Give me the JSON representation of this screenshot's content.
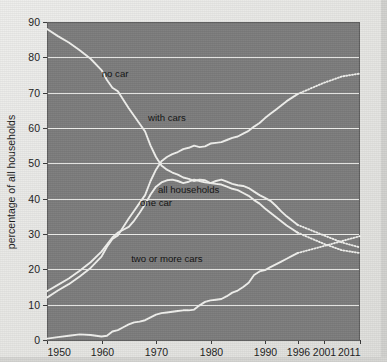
{
  "chart_data": {
    "type": "line",
    "title": "",
    "subtitle": "",
    "xlabel": "",
    "ylabel": "percentage of all households",
    "xlim": [
      1950,
      2011
    ],
    "ylim": [
      0,
      90
    ],
    "grid": true,
    "grid_axis": "y",
    "legend_position": "inline-labels",
    "x_tick_labels": [
      "1950",
      "1960",
      "1970",
      "1980",
      "1990",
      "1996",
      "2001",
      "2011"
    ],
    "x_tick_values": [
      1950,
      1960,
      1970,
      1980,
      1990,
      1996,
      2001,
      2011
    ],
    "y_tick_labels": [
      "0",
      "10",
      "20",
      "30",
      "40",
      "50",
      "60",
      "70",
      "80",
      "90"
    ],
    "y_tick_values": [
      0,
      10,
      20,
      30,
      40,
      50,
      60,
      70,
      80,
      90
    ],
    "colors": {
      "plot_background": "#7d7d7d",
      "page_background": "#e9e9e7",
      "line": "#f1f1ee",
      "gridline": "#ededea",
      "text": "#111111"
    },
    "annotations": [
      {
        "text": "no car",
        "x": 1962.5,
        "y": 74.5
      },
      {
        "text": "with cars",
        "x": 1972.0,
        "y": 62.0
      },
      {
        "text": "all households",
        "x": 1976.0,
        "y": 41.5
      },
      {
        "text": "one car",
        "x": 1970.0,
        "y": 38.0
      },
      {
        "text": "two or more cars",
        "x": 1972.0,
        "y": 22.0
      }
    ],
    "series": [
      {
        "name": "no car",
        "solid_until": 1996,
        "values": [
          [
            1950,
            88.0
          ],
          [
            1952,
            86.0
          ],
          [
            1954,
            84.2
          ],
          [
            1956,
            82.0
          ],
          [
            1958,
            79.6
          ],
          [
            1960,
            76.4
          ],
          [
            1961,
            73.6
          ],
          [
            1962,
            71.4
          ],
          [
            1963,
            70.4
          ],
          [
            1964,
            68.0
          ],
          [
            1965,
            65.6
          ],
          [
            1966,
            63.4
          ],
          [
            1967,
            61.2
          ],
          [
            1968,
            59.0
          ],
          [
            1969,
            55.0
          ],
          [
            1970,
            51.8
          ],
          [
            1971,
            49.4
          ],
          [
            1972,
            48.2
          ],
          [
            1973,
            47.4
          ],
          [
            1974,
            46.8
          ],
          [
            1975,
            46.0
          ],
          [
            1976,
            45.6
          ],
          [
            1977,
            45.0
          ],
          [
            1978,
            45.4
          ],
          [
            1979,
            45.2
          ],
          [
            1980,
            44.4
          ],
          [
            1981,
            44.2
          ],
          [
            1982,
            44.0
          ],
          [
            1983,
            43.4
          ],
          [
            1984,
            42.8
          ],
          [
            1985,
            42.4
          ],
          [
            1986,
            41.6
          ],
          [
            1987,
            40.8
          ],
          [
            1988,
            39.6
          ],
          [
            1989,
            38.6
          ],
          [
            1990,
            37.2
          ],
          [
            1991,
            36.0
          ],
          [
            1992,
            34.8
          ],
          [
            1993,
            33.6
          ],
          [
            1994,
            32.4
          ],
          [
            1995,
            31.4
          ],
          [
            1996,
            30.4
          ],
          [
            2001,
            27.2
          ],
          [
            2006,
            25.4
          ],
          [
            2011,
            24.6
          ]
        ]
      },
      {
        "name": "with cars",
        "solid_until": 1996,
        "values": [
          [
            1950,
            12.0
          ],
          [
            1952,
            14.0
          ],
          [
            1954,
            15.8
          ],
          [
            1956,
            18.0
          ],
          [
            1958,
            20.4
          ],
          [
            1960,
            23.6
          ],
          [
            1961,
            26.4
          ],
          [
            1962,
            28.6
          ],
          [
            1963,
            29.6
          ],
          [
            1964,
            32.0
          ],
          [
            1965,
            34.4
          ],
          [
            1966,
            36.6
          ],
          [
            1967,
            38.8
          ],
          [
            1968,
            41.0
          ],
          [
            1969,
            45.0
          ],
          [
            1970,
            48.2
          ],
          [
            1971,
            50.6
          ],
          [
            1972,
            51.8
          ],
          [
            1973,
            52.6
          ],
          [
            1974,
            53.2
          ],
          [
            1975,
            54.0
          ],
          [
            1976,
            54.4
          ],
          [
            1977,
            55.0
          ],
          [
            1978,
            54.6
          ],
          [
            1979,
            54.8
          ],
          [
            1980,
            55.6
          ],
          [
            1981,
            55.8
          ],
          [
            1982,
            56.0
          ],
          [
            1983,
            56.6
          ],
          [
            1984,
            57.2
          ],
          [
            1985,
            57.6
          ],
          [
            1986,
            58.4
          ],
          [
            1987,
            59.2
          ],
          [
            1988,
            60.4
          ],
          [
            1989,
            61.4
          ],
          [
            1990,
            62.8
          ],
          [
            1991,
            64.0
          ],
          [
            1992,
            65.2
          ],
          [
            1993,
            66.4
          ],
          [
            1994,
            67.6
          ],
          [
            1995,
            68.6
          ],
          [
            1996,
            69.6
          ],
          [
            2001,
            72.8
          ],
          [
            2006,
            74.6
          ],
          [
            2011,
            75.4
          ]
        ]
      },
      {
        "name": "one car",
        "solid_until": 1996,
        "values": [
          [
            1950,
            13.8
          ],
          [
            1952,
            15.6
          ],
          [
            1954,
            17.4
          ],
          [
            1956,
            19.6
          ],
          [
            1958,
            22.0
          ],
          [
            1960,
            25.0
          ],
          [
            1961,
            27.0
          ],
          [
            1962,
            29.0
          ],
          [
            1963,
            30.4
          ],
          [
            1964,
            31.2
          ],
          [
            1965,
            32.0
          ],
          [
            1966,
            33.8
          ],
          [
            1967,
            36.0
          ],
          [
            1968,
            38.4
          ],
          [
            1969,
            41.2
          ],
          [
            1970,
            43.4
          ],
          [
            1971,
            44.6
          ],
          [
            1972,
            45.2
          ],
          [
            1973,
            45.4
          ],
          [
            1974,
            45.0
          ],
          [
            1975,
            44.4
          ],
          [
            1976,
            44.8
          ],
          [
            1977,
            45.4
          ],
          [
            1978,
            45.0
          ],
          [
            1979,
            44.6
          ],
          [
            1980,
            44.4
          ],
          [
            1981,
            45.0
          ],
          [
            1982,
            45.4
          ],
          [
            1983,
            44.8
          ],
          [
            1984,
            44.2
          ],
          [
            1985,
            43.8
          ],
          [
            1986,
            43.6
          ],
          [
            1987,
            43.0
          ],
          [
            1988,
            42.0
          ],
          [
            1989,
            41.0
          ],
          [
            1990,
            40.2
          ],
          [
            1991,
            39.4
          ],
          [
            1992,
            38.0
          ],
          [
            1993,
            36.4
          ],
          [
            1994,
            35.0
          ],
          [
            1995,
            33.8
          ],
          [
            1996,
            32.6
          ],
          [
            2001,
            29.6
          ],
          [
            2006,
            27.6
          ],
          [
            2011,
            26.2
          ]
        ]
      },
      {
        "name": "two or more cars",
        "solid_until": 1996,
        "values": [
          [
            1950,
            0.4
          ],
          [
            1952,
            0.8
          ],
          [
            1954,
            1.2
          ],
          [
            1956,
            1.6
          ],
          [
            1958,
            1.4
          ],
          [
            1960,
            1.0
          ],
          [
            1961,
            1.2
          ],
          [
            1962,
            2.4
          ],
          [
            1963,
            2.8
          ],
          [
            1964,
            3.6
          ],
          [
            1965,
            4.4
          ],
          [
            1966,
            5.0
          ],
          [
            1967,
            5.2
          ],
          [
            1968,
            5.6
          ],
          [
            1969,
            6.4
          ],
          [
            1970,
            7.2
          ],
          [
            1971,
            7.6
          ],
          [
            1972,
            7.8
          ],
          [
            1973,
            8.0
          ],
          [
            1974,
            8.2
          ],
          [
            1975,
            8.4
          ],
          [
            1976,
            8.4
          ],
          [
            1977,
            8.6
          ],
          [
            1978,
            9.8
          ],
          [
            1979,
            10.8
          ],
          [
            1980,
            11.2
          ],
          [
            1981,
            11.4
          ],
          [
            1982,
            11.6
          ],
          [
            1983,
            12.4
          ],
          [
            1984,
            13.4
          ],
          [
            1985,
            14.0
          ],
          [
            1986,
            15.0
          ],
          [
            1987,
            16.2
          ],
          [
            1988,
            18.4
          ],
          [
            1989,
            19.4
          ],
          [
            1990,
            19.8
          ],
          [
            1991,
            20.6
          ],
          [
            1992,
            21.4
          ],
          [
            1993,
            22.2
          ],
          [
            1994,
            23.0
          ],
          [
            1995,
            23.8
          ],
          [
            1996,
            24.6
          ],
          [
            2001,
            26.6
          ],
          [
            2006,
            28.0
          ],
          [
            2011,
            29.4
          ]
        ]
      }
    ]
  },
  "figure": {
    "ylabel": "percentage of all households"
  }
}
